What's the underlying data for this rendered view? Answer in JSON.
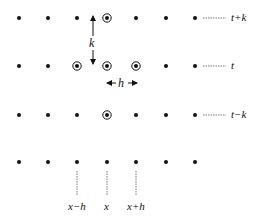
{
  "diagram": {
    "columns_x": [
      19,
      48,
      77,
      107,
      136,
      166,
      195
    ],
    "rows": [
      {
        "y": 18,
        "label": "t+k",
        "circled": [
          3
        ]
      },
      {
        "y": 66,
        "label": "t",
        "circled": [
          2,
          3,
          4
        ]
      },
      {
        "y": 115,
        "label": "t−k",
        "circled": [
          3
        ]
      },
      {
        "y": 162,
        "label": null,
        "circled": []
      }
    ],
    "spacing_labels": {
      "vertical": "k",
      "horizontal": "h"
    },
    "x_labels": [
      {
        "col": 2,
        "text": "x−h"
      },
      {
        "col": 3,
        "text": "x"
      },
      {
        "col": 4,
        "text": "x+h"
      }
    ],
    "colors": {
      "dot": "#111111",
      "line": "#555555"
    }
  }
}
